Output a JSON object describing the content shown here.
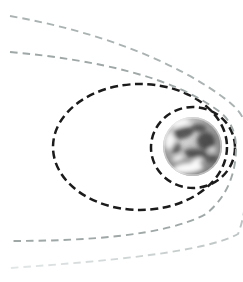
{
  "figure": {
    "name": "earth-orbit-trajectories-diagram",
    "background": "#ffffff",
    "canvas": {
      "width": 243,
      "height": 282
    },
    "earth": {
      "cx": 192.5,
      "cy": 146.5,
      "r": 29.5,
      "base_highlight": "#efefef",
      "base_mid": "#9b9b9b",
      "base_edge": "#7a7a7a",
      "land_color": "#3c3c3c",
      "cloud_color": "#ffffff",
      "dark_patches": [
        {
          "cx": 183,
          "cy": 133,
          "rx": 11,
          "ry": 6,
          "rot": -15,
          "opacity": 0.85
        },
        {
          "cx": 206,
          "cy": 141,
          "rx": 9,
          "ry": 9,
          "rot": 0,
          "opacity": 0.85
        },
        {
          "cx": 196,
          "cy": 154,
          "rx": 12,
          "ry": 5,
          "rot": 8,
          "opacity": 0.8
        },
        {
          "cx": 176,
          "cy": 148,
          "rx": 5,
          "ry": 6,
          "rot": 0,
          "opacity": 0.7
        },
        {
          "cx": 199,
          "cy": 128,
          "rx": 8,
          "ry": 4,
          "rot": 5,
          "opacity": 0.8
        },
        {
          "cx": 212,
          "cy": 159,
          "rx": 6,
          "ry": 4,
          "rot": -10,
          "opacity": 0.65
        }
      ],
      "cloud_patches": [
        {
          "cx": 188,
          "cy": 168,
          "rx": 15,
          "ry": 5,
          "rot": -5,
          "opacity": 0.95
        },
        {
          "cx": 197,
          "cy": 161,
          "rx": 6,
          "ry": 3,
          "rot": -25,
          "opacity": 0.9
        },
        {
          "cx": 170,
          "cy": 141,
          "rx": 5,
          "ry": 8,
          "rot": 10,
          "opacity": 0.85
        },
        {
          "cx": 181,
          "cy": 123,
          "rx": 9,
          "ry": 3.5,
          "rot": -12,
          "opacity": 0.9
        },
        {
          "cx": 212,
          "cy": 150,
          "rx": 4,
          "ry": 2.5,
          "rot": 0,
          "opacity": 0.7
        },
        {
          "cx": 178,
          "cy": 158,
          "rx": 6,
          "ry": 3,
          "rot": -20,
          "opacity": 0.8
        }
      ]
    },
    "orbit_stroke_black": "#1b1b1b",
    "orbit_dash_black": "8 4.5",
    "orbit_width_black": 2.5,
    "escape_dash": "7.5 5",
    "escape_width": 1.9,
    "fade_gradient": {
      "from": "#b7bebe",
      "to": "#e2e6e6"
    },
    "orbits": [
      {
        "id": "elliptical-orbit",
        "type": "ellipse",
        "cx": 140,
        "cy": 147,
        "rx": 87,
        "ry": 63,
        "stroke": "#1b1b1b",
        "width": 2.5,
        "dash": "8 4.5"
      },
      {
        "id": "circular-orbit",
        "type": "ellipse",
        "cx": 193,
        "cy": 147.5,
        "rx": 42,
        "ry": 40.5,
        "stroke": "#1b1b1b",
        "width": 2.5,
        "dash": "8 4.5"
      },
      {
        "id": "parabolic-trajectory",
        "type": "path",
        "d": "M 10 52 C 100 60 175 78 220 112 C 231 121 236 133 236 148 C 236 172 228 196 206 214 C 165 236 85 241 10 241",
        "stroke": "#9fa7a7",
        "width": 1.9,
        "dash": "7.5 5"
      },
      {
        "id": "hyperbolic-trajectory-upper",
        "type": "path",
        "d": "M 10 16 C 95 31 175 60 228 101 C 238 109 243 116 246 126",
        "stroke": "#aab2b2",
        "width": 1.9,
        "dash": "7.5 5"
      },
      {
        "id": "hyperbolic-trajectory-lower",
        "type": "path",
        "d": "M 246 158 C 247 190 246 214 238 234 C 205 252 110 261 10 268",
        "stroke": "url(#fade-grad)",
        "width": 1.9,
        "dash": "7.5 5"
      }
    ]
  }
}
